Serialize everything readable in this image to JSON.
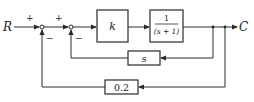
{
  "diagram": {
    "type": "block-diagram",
    "input_label": "R",
    "output_label": "C",
    "summing_junctions": [
      {
        "id": "sum1",
        "signs": {
          "top_input": "+",
          "feedback": "−"
        }
      },
      {
        "id": "sum2",
        "signs": {
          "top_input": "+",
          "feedback": "−"
        }
      }
    ],
    "forward_blocks": [
      {
        "id": "gain",
        "label": "k"
      },
      {
        "id": "plant",
        "numerator": "1",
        "denominator": "(s + 1)"
      }
    ],
    "feedback_blocks": [
      {
        "id": "inner",
        "label": "s"
      },
      {
        "id": "outer",
        "label": "0.2"
      }
    ],
    "signs": {
      "plus1": "+",
      "plus2": "+",
      "minus1": "−",
      "minus2": "−"
    }
  }
}
